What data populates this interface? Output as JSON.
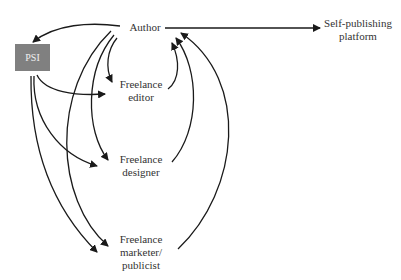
{
  "diagram": {
    "nodes": {
      "author": "Author",
      "platform_line1": "Self-publishing",
      "platform_line2": "platform",
      "psi": "PSI",
      "editor_line1": "Freelance",
      "editor_line2": "editor",
      "designer_line1": "Freelance",
      "designer_line2": "designer",
      "marketer_line1": "Freelance",
      "marketer_line2": "marketer/",
      "marketer_line3": "publicist"
    },
    "colors": {
      "psi_box": "#808080",
      "line": "#1a1a1a"
    },
    "edges": [
      {
        "from": "Author",
        "to": "Self-publishing platform"
      },
      {
        "from": "Author",
        "to": "PSI"
      },
      {
        "from": "Author",
        "to": "Freelance editor"
      },
      {
        "from": "Author",
        "to": "Freelance designer"
      },
      {
        "from": "Author",
        "to": "Freelance marketer/publicist"
      },
      {
        "from": "PSI",
        "to": "Freelance editor"
      },
      {
        "from": "PSI",
        "to": "Freelance designer"
      },
      {
        "from": "PSI",
        "to": "Freelance marketer/publicist"
      },
      {
        "from": "Freelance editor",
        "to": "Author"
      },
      {
        "from": "Freelance designer",
        "to": "Author"
      },
      {
        "from": "Freelance marketer/publicist",
        "to": "Author"
      }
    ]
  }
}
